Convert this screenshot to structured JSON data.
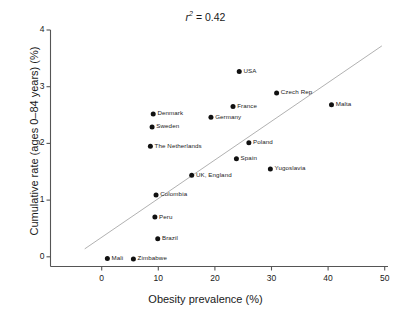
{
  "chart_data": {
    "type": "scatter",
    "title": "r2 = 0.42",
    "title_parts": {
      "symbol": "r",
      "exponent": "2",
      "equals": " = ",
      "value": "0.42"
    },
    "xlabel": "Obesity prevalence (%)",
    "ylabel": "Cumulative rate (ages 0–84 years) (%)",
    "xlim": [
      -3,
      52
    ],
    "ylim": [
      -0.55,
      4.0
    ],
    "xticks": [
      0,
      10,
      20,
      30,
      40,
      50
    ],
    "yticks": [
      0,
      1,
      2,
      3,
      4
    ],
    "grid": false,
    "legend": "none",
    "point_color": "#111111",
    "line_color": "#a8a8a8",
    "axis_color": "#555555",
    "trendline": {
      "x0": -3.0,
      "y0": 0.14,
      "x1": 49.5,
      "y1": 3.72
    },
    "points": [
      {
        "label": "USA",
        "x": 24.3,
        "y": 3.27,
        "label_side": "right"
      },
      {
        "label": "Czech Rep",
        "x": 30.9,
        "y": 2.89,
        "label_side": "right"
      },
      {
        "label": "Malta",
        "x": 40.6,
        "y": 2.68,
        "label_side": "right"
      },
      {
        "label": "France",
        "x": 23.2,
        "y": 2.65,
        "label_side": "right"
      },
      {
        "label": "Denmark",
        "x": 9.1,
        "y": 2.52,
        "label_side": "right"
      },
      {
        "label": "Germany",
        "x": 19.3,
        "y": 2.46,
        "label_side": "right"
      },
      {
        "label": "Sweden",
        "x": 8.9,
        "y": 2.29,
        "label_side": "right"
      },
      {
        "label": "Poland",
        "x": 26.0,
        "y": 2.01,
        "label_side": "right"
      },
      {
        "label": "The Netherlands",
        "x": 8.6,
        "y": 1.95,
        "label_side": "right"
      },
      {
        "label": "Spain",
        "x": 23.8,
        "y": 1.73,
        "label_side": "right"
      },
      {
        "label": "Yugoslavia",
        "x": 29.8,
        "y": 1.55,
        "label_side": "right"
      },
      {
        "label": "UK, England",
        "x": 15.9,
        "y": 1.44,
        "label_side": "right"
      },
      {
        "label": "Colombia",
        "x": 9.6,
        "y": 1.09,
        "label_side": "right"
      },
      {
        "label": "Peru",
        "x": 9.4,
        "y": 0.7,
        "label_side": "right"
      },
      {
        "label": "Brazil",
        "x": 9.9,
        "y": 0.32,
        "label_side": "right"
      },
      {
        "label": "Mali",
        "x": 1.0,
        "y": -0.03,
        "label_side": "right"
      },
      {
        "label": "Zimbabwe",
        "x": 5.6,
        "y": -0.04,
        "label_side": "right"
      }
    ]
  }
}
